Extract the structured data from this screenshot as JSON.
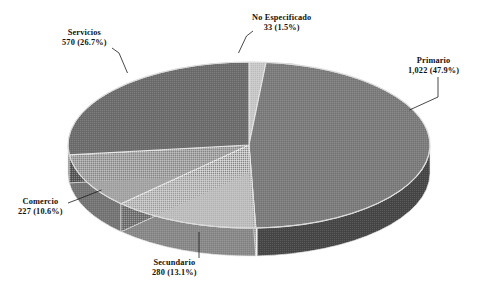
{
  "chart_data": {
    "type": "pie",
    "title": "",
    "subtitle": "",
    "xlabel": "",
    "ylabel": "",
    "legend_position": "none",
    "grid": false,
    "three_d": true,
    "total": 2132,
    "categories": [
      "No Especificado",
      "Primario",
      "Secundario",
      "Comercio",
      "Servicios"
    ],
    "values": [
      33,
      1022,
      280,
      227,
      570
    ],
    "percentages": [
      1.5,
      47.9,
      13.1,
      10.6,
      26.7
    ],
    "slices": [
      {
        "label": "No Especificado",
        "value": 33,
        "value_text": "33",
        "percent": 1.5,
        "percent_text": "(1.5%)",
        "value_line": "33 (1.5%)",
        "color": "#c9c9c9",
        "side_color": "#8f8f8f",
        "start_pct": 0.0,
        "end_pct": 1.5
      },
      {
        "label": "Primario",
        "value": 1022,
        "value_text": "1,022",
        "percent": 47.9,
        "percent_text": "(47.9%)",
        "value_line": "1,022 (47.9%)",
        "color": "#7d7d7d",
        "side_color": "#474747",
        "start_pct": 1.5,
        "end_pct": 49.4
      },
      {
        "label": "Secundario",
        "value": 280,
        "value_text": "280",
        "percent": 13.1,
        "percent_text": "(13.1%)",
        "value_line": "280 (13.1%)",
        "color": "#bfbfbf",
        "side_color": "#8a8a8a",
        "start_pct": 49.4,
        "end_pct": 62.5
      },
      {
        "label": "Comercio",
        "value": 227,
        "value_text": "227",
        "percent": 10.6,
        "percent_text": "(10.6%)",
        "value_line": "227 (10.6%)",
        "color": "#a6a6a6",
        "side_color": "#767676",
        "start_pct": 62.5,
        "end_pct": 73.1
      },
      {
        "label": "Servicios",
        "value": 570,
        "value_text": "570",
        "percent": 26.7,
        "percent_text": "(26.7%)",
        "value_line": "570 (26.7%)",
        "color": "#6e6e6e",
        "side_color": "#5a5a5a",
        "start_pct": 73.1,
        "end_pct": 100.0
      }
    ],
    "colors": {
      "background": "#ffffff",
      "text": "#111111",
      "leader_line": "#1a1a1a",
      "slice_edge": "#e8e8e8"
    }
  },
  "labels": {
    "no_especificado": {
      "name": "No Especificado",
      "value_line": "33 (1.5%)"
    },
    "primario": {
      "name": "Primario",
      "value_line": "1,022 (47.9%)"
    },
    "servicios": {
      "name": "Servicios",
      "value_line": "570 (26.7%)"
    },
    "comercio": {
      "name": "Comercio",
      "value_line": "227 (10.6%)"
    },
    "secundario": {
      "name": "Secundario",
      "value_line": "280 (13.1%)"
    }
  }
}
